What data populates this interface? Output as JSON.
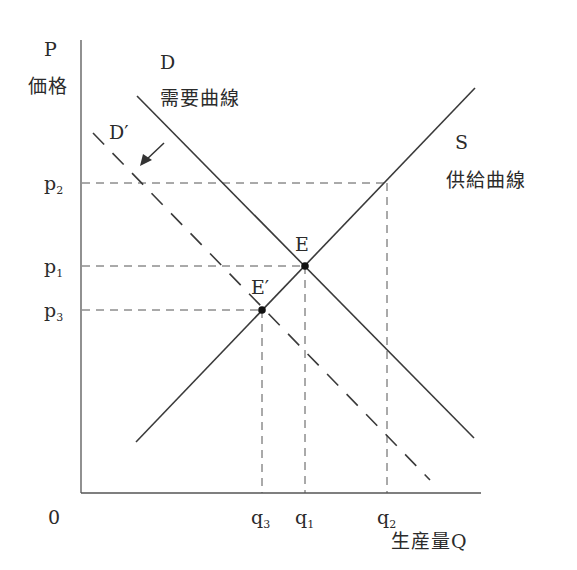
{
  "diagram": {
    "type": "supply-demand",
    "axes": {
      "y_symbol": "P",
      "y_label": "価格",
      "x_label": "生産量Q",
      "origin": "0"
    },
    "curves": {
      "demand": {
        "symbol": "D",
        "label": "需要曲線",
        "style": "solid"
      },
      "supply": {
        "symbol": "S",
        "label": "供給曲線",
        "style": "solid"
      },
      "shifted_demand": {
        "symbol": "D′",
        "style": "dashed"
      }
    },
    "points": {
      "equilibrium": "E",
      "new_equilibrium": "E′"
    },
    "price_ticks": [
      {
        "base": "p",
        "sub": "2"
      },
      {
        "base": "p",
        "sub": "1"
      },
      {
        "base": "p",
        "sub": "3"
      }
    ],
    "quantity_ticks": [
      {
        "base": "q",
        "sub": "3"
      },
      {
        "base": "q",
        "sub": "1"
      },
      {
        "base": "q",
        "sub": "2"
      }
    ],
    "arrow": "shift-left-arrow"
  }
}
